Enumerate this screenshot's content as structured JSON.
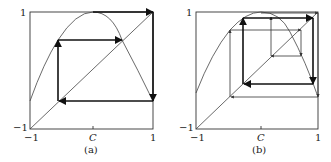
{
  "panels": [
    {
      "id": "a",
      "caption": "(a)",
      "box": {
        "x0": 30,
        "x1": 153,
        "y0": 12,
        "y1": 129
      },
      "axis": {
        "xmin_label": "−1",
        "xmax_label": "1",
        "ymin_label": "−1",
        "ymax_label": "1",
        "center_label": "C"
      },
      "center_x": 93,
      "curve_start_y": 101,
      "thick_web": [
        [
          58,
          102
        ],
        [
          58,
          40
        ],
        [
          122,
          40
        ]
      ],
      "thick_web2": [
        [
          93,
          12
        ],
        [
          153,
          12
        ],
        [
          153,
          101
        ],
        [
          58,
          101
        ]
      ],
      "thin_web": []
    },
    {
      "id": "b",
      "caption": "(b)",
      "box": {
        "x0": 196,
        "x1": 318,
        "y0": 12,
        "y1": 129
      },
      "axis": {
        "xmin_label": "−1",
        "xmax_label": "1",
        "ymin_label": "−1",
        "ymax_label": "1",
        "center_label": "C"
      },
      "center_x": 261,
      "curve_start_y": 93,
      "thick_web": [
        [
          243,
          84
        ],
        [
          243,
          18
        ],
        [
          313,
          18
        ],
        [
          313,
          84
        ],
        [
          243,
          84
        ]
      ],
      "thin_web": [
        [
          230,
          97
        ],
        [
          230,
          30
        ],
        [
          301,
          30
        ],
        [
          301,
          56
        ],
        [
          271,
          56
        ],
        [
          271,
          18
        ],
        [
          271,
          13
        ],
        [
          318,
          13
        ],
        [
          318,
          97
        ],
        [
          230,
          97
        ]
      ]
    }
  ]
}
